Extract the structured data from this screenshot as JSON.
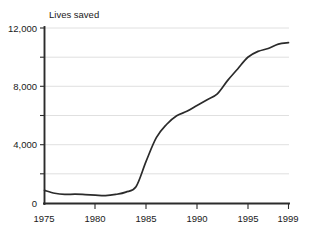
{
  "chart_data": {
    "type": "line",
    "title": "",
    "ylabel": "Lives saved",
    "xlabel": "",
    "xlim": [
      1975,
      1999
    ],
    "ylim": [
      0,
      12000
    ],
    "grid": true,
    "legend_position": "none",
    "x_tick_labels": [
      "1975",
      "1980",
      "1985",
      "1990",
      "1995",
      "1999"
    ],
    "x_ticks": [
      1975,
      1980,
      1985,
      1990,
      1995,
      1999
    ],
    "y_tick_labels": [
      "0",
      "4,000",
      "8,000",
      "12,000"
    ],
    "y_ticks": [
      0,
      4000,
      8000,
      12000
    ],
    "y_gridlines": [
      2000,
      4000,
      6000,
      8000,
      10000,
      12000
    ],
    "series": [
      {
        "name": "Lives saved",
        "color": "#2b2b2b",
        "x": [
          1975,
          1976,
          1977,
          1978,
          1979,
          1980,
          1981,
          1982,
          1983,
          1984,
          1985,
          1986,
          1987,
          1988,
          1989,
          1990,
          1991,
          1992,
          1993,
          1994,
          1995,
          1996,
          1997,
          1998,
          1999
        ],
        "values": [
          900,
          700,
          620,
          640,
          610,
          570,
          540,
          620,
          780,
          1150,
          2900,
          4500,
          5400,
          6000,
          6300,
          6700,
          7100,
          7500,
          8400,
          9200,
          10000,
          10400,
          10600,
          10900,
          11000
        ]
      }
    ]
  }
}
